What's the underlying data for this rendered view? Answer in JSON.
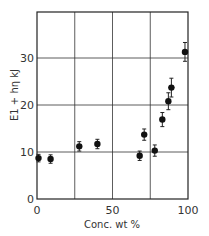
{
  "chart_data": {
    "type": "scatter",
    "title": "",
    "xlabel": "Conc. wt %",
    "ylabel": "E1 + hη  kJ",
    "xlim": [
      0,
      100
    ],
    "ylim": [
      0,
      40
    ],
    "grid": true,
    "x_ticks": [
      "0",
      "50",
      "100"
    ],
    "y_ticks": [
      "0",
      "10",
      "20",
      "30"
    ],
    "series": [
      {
        "name": "data",
        "points": [
          {
            "x": 1,
            "y": 8.7,
            "xerr": 0,
            "yerr": 0.8
          },
          {
            "x": 9,
            "y": 8.5,
            "xerr": 0,
            "yerr": 0.9
          },
          {
            "x": 28,
            "y": 11.2,
            "xerr": 0,
            "yerr": 1.0
          },
          {
            "x": 40,
            "y": 11.7,
            "xerr": 0,
            "yerr": 1.0
          },
          {
            "x": 68,
            "y": 9.2,
            "xerr": 0,
            "yerr": 1.0
          },
          {
            "x": 71,
            "y": 13.7,
            "xerr": 0,
            "yerr": 1.2
          },
          {
            "x": 78,
            "y": 10.3,
            "xerr": 0,
            "yerr": 1.2
          },
          {
            "x": 83,
            "y": 16.9,
            "xerr": 1.5,
            "yerr": 1.5
          },
          {
            "x": 87,
            "y": 20.8,
            "xerr": 1.5,
            "yerr": 1.8
          },
          {
            "x": 89,
            "y": 23.7,
            "xerr": 2,
            "yerr": 2.0
          },
          {
            "x": 98,
            "y": 31.3,
            "xerr": 0,
            "yerr": 2.0
          }
        ]
      }
    ]
  }
}
